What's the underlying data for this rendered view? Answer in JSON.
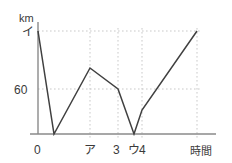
{
  "chart_data": {
    "type": "line",
    "title": "",
    "xlabel": "時間",
    "ylabel": "km",
    "grid": true,
    "legend": null,
    "xlim": [
      0,
      5
    ],
    "ylim": [
      0,
      100
    ],
    "x_ticks": [
      {
        "value": 0,
        "label": "0",
        "px": 38
      },
      {
        "value": 2,
        "label": "ア",
        "px": 90
      },
      {
        "value": 3,
        "label": "3",
        "px": 118
      },
      {
        "value": 3.6,
        "label": "ウ",
        "px": 134
      },
      {
        "value": 4,
        "label": "4",
        "px": 142
      },
      {
        "value": 5,
        "label": "",
        "px": 197
      }
    ],
    "y_ticks": [
      {
        "value": 100,
        "label": "イ",
        "px": 31
      },
      {
        "value": 60,
        "label": "60",
        "px": 89
      },
      {
        "value": 0,
        "label": "",
        "px": 134
      }
    ],
    "gridlines": {
      "vertical_px": [
        90,
        118,
        142,
        197
      ],
      "horizontal_px": [
        31,
        89
      ]
    },
    "series": [
      {
        "name": "distance",
        "points_px": [
          {
            "x": 38,
            "y": 31
          },
          {
            "x": 54,
            "y": 134
          },
          {
            "x": 90,
            "y": 68
          },
          {
            "x": 118,
            "y": 89
          },
          {
            "x": 134,
            "y": 134
          },
          {
            "x": 142,
            "y": 110
          },
          {
            "x": 197,
            "y": 31
          }
        ],
        "points_data": [
          {
            "x": 0,
            "y": 100
          },
          {
            "x": 0.6,
            "y": 0
          },
          {
            "x": 2,
            "y": 78
          },
          {
            "x": 3,
            "y": 60
          },
          {
            "x": 3.6,
            "y": 0
          },
          {
            "x": 4,
            "y": 23
          },
          {
            "x": 5,
            "y": 100
          }
        ]
      }
    ]
  },
  "labels": {
    "y_unit": "km",
    "y_top": "イ",
    "y_mid": "60",
    "x_origin": "0",
    "x_a": "ア",
    "x_three": "3",
    "x_u": "ウ",
    "x_four": "4",
    "x_axis_title": "時間"
  },
  "colors": {
    "line": "#404040",
    "axis": "#8a8a8a",
    "grid": "#c9c9c9",
    "text": "#3a3a3a",
    "background": "#ffffff"
  }
}
